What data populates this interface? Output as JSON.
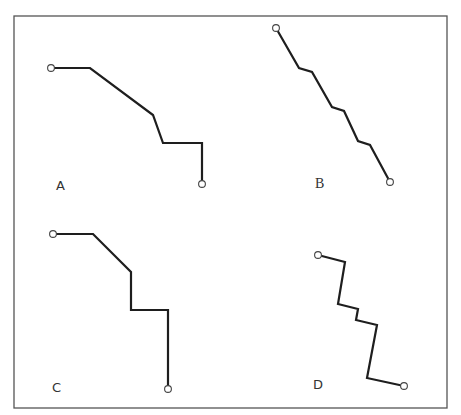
{
  "figure": {
    "frame": {
      "x1": 14,
      "y1": 16,
      "x2": 447,
      "y2": 408,
      "color": "#555555"
    },
    "line_color": "#1e1e1e",
    "panels": [
      {
        "label": "A",
        "label_pos": [
          56,
          190
        ],
        "label_font": "sans",
        "points": [
          [
            51,
            68
          ],
          [
            90,
            68
          ],
          [
            153,
            115
          ],
          [
            163,
            143
          ],
          [
            202,
            143
          ],
          [
            202,
            184
          ]
        ]
      },
      {
        "label": "B",
        "label_pos": [
          315,
          188
        ],
        "label_font": "serif",
        "points": [
          [
            276,
            28
          ],
          [
            299,
            68
          ],
          [
            312,
            72
          ],
          [
            332,
            107
          ],
          [
            344,
            111
          ],
          [
            358,
            141
          ],
          [
            370,
            145
          ],
          [
            390,
            182
          ]
        ]
      },
      {
        "label": "C",
        "label_pos": [
          52,
          392
        ],
        "label_font": "sans",
        "points": [
          [
            53,
            234
          ],
          [
            93,
            234
          ],
          [
            131,
            272
          ],
          [
            131,
            310
          ],
          [
            168,
            310
          ],
          [
            168,
            389
          ]
        ]
      },
      {
        "label": "D",
        "label_pos": [
          313,
          389
        ],
        "label_font": "sans",
        "points": [
          [
            318,
            255
          ],
          [
            345,
            262
          ],
          [
            338,
            304
          ],
          [
            358,
            309
          ],
          [
            356,
            320
          ],
          [
            377,
            325
          ],
          [
            367,
            378
          ],
          [
            404,
            386
          ]
        ]
      }
    ]
  }
}
